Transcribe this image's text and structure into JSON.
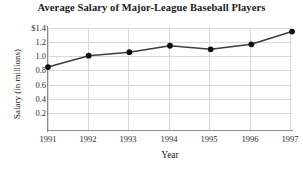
{
  "chart_data": {
    "type": "line",
    "title": "Average Salary of Major-League Baseball Players",
    "xlabel": "Year",
    "ylabel": "Salary (in millions)",
    "categories": [
      "1991",
      "1992",
      "1993",
      "1994",
      "1995",
      "1996",
      "1997"
    ],
    "x": [
      1991,
      1992,
      1993,
      1994,
      1995,
      1996,
      1997
    ],
    "values": [
      0.85,
      1.01,
      1.06,
      1.15,
      1.1,
      1.17,
      1.35
    ],
    "series": [
      {
        "name": "Average Salary",
        "values": [
          0.85,
          1.01,
          1.06,
          1.15,
          1.1,
          1.17,
          1.35
        ]
      }
    ],
    "ylim": [
      0,
      1.4
    ],
    "xlim": [
      1991,
      1997
    ],
    "ytick_values": [
      0.2,
      0.4,
      0.6,
      0.8,
      1.0,
      1.2,
      1.4
    ],
    "ytick_labels": [
      "0.2",
      "0.4",
      "0.6",
      "0.8",
      "1.0",
      "1.2",
      "$1.4"
    ],
    "xtick_labels": [
      "1991",
      "1992",
      "1993",
      "1994",
      "1995",
      "1996",
      "1997"
    ],
    "grid": true,
    "legend": false,
    "marker": "filled-circle",
    "line_color": "#3d3d3d",
    "marker_color": "#101010",
    "grid_color": "#d8d8d8",
    "axis_color": "#8a8a8a",
    "background": "#ffffff"
  }
}
